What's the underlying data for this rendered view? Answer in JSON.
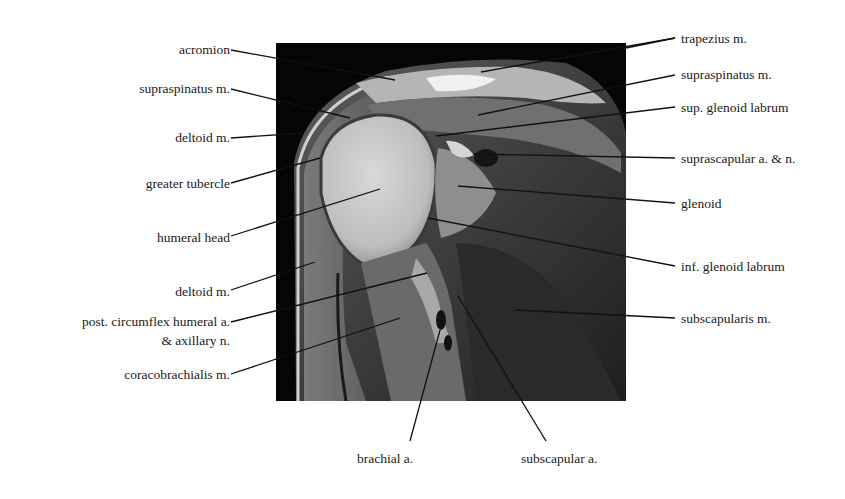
{
  "figure": {
    "labels_left": [
      {
        "text": "acromion",
        "x": 230,
        "y": 42
      },
      {
        "text": "supraspinatus m.",
        "x": 230,
        "y": 81
      },
      {
        "text": "deltoid m.",
        "x": 230,
        "y": 130
      },
      {
        "text": "greater tubercle",
        "x": 230,
        "y": 176
      },
      {
        "text": "humeral head",
        "x": 230,
        "y": 230
      },
      {
        "text": "deltoid m.",
        "x": 230,
        "y": 284
      },
      {
        "text": "post. circumflex humeral a.",
        "x": 230,
        "y": 314
      },
      {
        "text": "& axillary n.",
        "x": 230,
        "y": 333
      },
      {
        "text": "coracobrachialis m.",
        "x": 230,
        "y": 367
      }
    ],
    "labels_right": [
      {
        "text": "trapezius m.",
        "x": 681,
        "y": 31
      },
      {
        "text": "supraspinatus m.",
        "x": 681,
        "y": 67
      },
      {
        "text": "sup. glenoid labrum",
        "x": 681,
        "y": 100
      },
      {
        "text": "suprascapular a. & n.",
        "x": 681,
        "y": 151
      },
      {
        "text": "glenoid",
        "x": 681,
        "y": 196
      },
      {
        "text": "inf. glenoid labrum",
        "x": 681,
        "y": 259
      },
      {
        "text": "subscapularis m.",
        "x": 681,
        "y": 311
      }
    ],
    "labels_bottom": [
      {
        "text": "brachial a.",
        "x": 392,
        "y": 451
      },
      {
        "text": "subscapular a.",
        "x": 565,
        "y": 451
      }
    ]
  }
}
